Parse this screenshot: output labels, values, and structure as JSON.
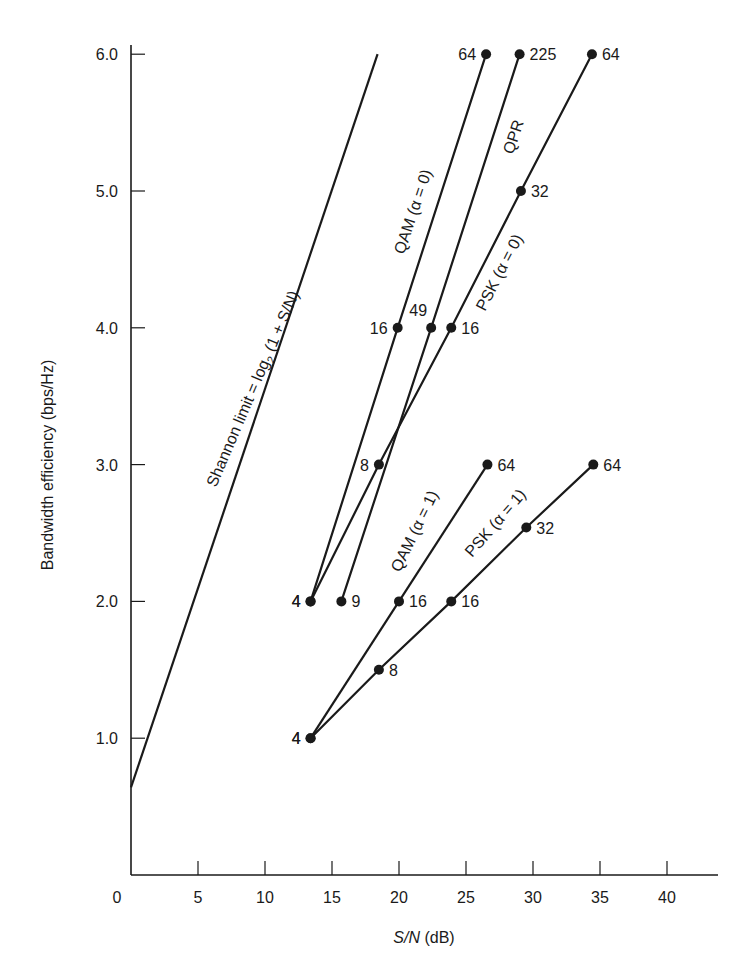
{
  "chart_data": {
    "type": "line",
    "title": "",
    "xlabel": "S/N (dB)",
    "ylabel": "Bandwidth efficiency (bps/Hz)",
    "xlim": [
      0,
      43
    ],
    "ylim": [
      0,
      6.4
    ],
    "grid": false,
    "legend": "none (inline labels along lines)",
    "x_ticks": [
      0,
      5,
      10,
      15,
      20,
      25,
      30,
      35,
      40
    ],
    "x_tick_labels": [
      "0",
      "5",
      "10",
      "15",
      "20",
      "25",
      "30",
      "35",
      "40"
    ],
    "y_ticks": [
      1.0,
      2.0,
      3.0,
      4.0,
      5.0,
      6.0
    ],
    "y_tick_labels": [
      "1.0",
      "2.0",
      "3.0",
      "4.0",
      "5.0",
      "6.0"
    ],
    "series": [
      {
        "name": "Shannon limit = log2 (1 + S/N)",
        "markers": false,
        "points": [
          {
            "x": 0,
            "y": 0.64,
            "label": ""
          },
          {
            "x": 18.4,
            "y": 6.0,
            "label": ""
          }
        ]
      },
      {
        "name": "QAM (α = 0)",
        "markers": true,
        "points": [
          {
            "x": 13.4,
            "y": 2.0,
            "label": "4"
          },
          {
            "x": 19.9,
            "y": 4.0,
            "label": "16"
          },
          {
            "x": 26.5,
            "y": 6.0,
            "label": "64"
          }
        ]
      },
      {
        "name": "QPR",
        "markers": true,
        "points": [
          {
            "x": 15.7,
            "y": 2.0,
            "label": "9"
          },
          {
            "x": 22.4,
            "y": 4.0,
            "label": "49"
          },
          {
            "x": 29.0,
            "y": 6.0,
            "label": "225"
          }
        ]
      },
      {
        "name": "PSK (α = 0)",
        "markers": true,
        "points": [
          {
            "x": 13.4,
            "y": 2.0,
            "label": "4"
          },
          {
            "x": 18.5,
            "y": 3.0,
            "label": "8"
          },
          {
            "x": 23.9,
            "y": 4.0,
            "label": "16"
          },
          {
            "x": 29.1,
            "y": 5.0,
            "label": "32"
          },
          {
            "x": 34.4,
            "y": 6.0,
            "label": "64"
          }
        ]
      },
      {
        "name": "QAM (α = 1)",
        "markers": true,
        "points": [
          {
            "x": 13.4,
            "y": 1.0,
            "label": "4"
          },
          {
            "x": 20.0,
            "y": 2.0,
            "label": "16"
          },
          {
            "x": 26.6,
            "y": 3.0,
            "label": "64"
          }
        ]
      },
      {
        "name": "PSK (α = 1)",
        "markers": true,
        "points": [
          {
            "x": 13.4,
            "y": 1.0,
            "label": "4"
          },
          {
            "x": 18.5,
            "y": 1.5,
            "label": "8"
          },
          {
            "x": 23.9,
            "y": 2.0,
            "label": "16"
          },
          {
            "x": 29.5,
            "y": 2.54,
            "label": "32"
          },
          {
            "x": 34.5,
            "y": 3.0,
            "label": "64"
          }
        ]
      }
    ],
    "point_label_placement": [
      {
        "series": "QAM (α = 0)",
        "labels": [
          "left",
          "left",
          "left"
        ]
      },
      {
        "series": "QPR",
        "labels": [
          "right",
          "above",
          "right"
        ]
      },
      {
        "series": "PSK (α = 0)",
        "labels": [
          "left",
          "left",
          "right",
          "right",
          "right"
        ]
      },
      {
        "series": "QAM (α = 1)",
        "labels": [
          "left",
          "right",
          "right"
        ]
      },
      {
        "series": "PSK (α = 1)",
        "labels": [
          "left",
          "right",
          "right",
          "right",
          "right"
        ]
      }
    ]
  },
  "annotations": {
    "shannon": "Shannon limit = log",
    "shannon_sub": "2",
    "shannon_tail": " (1 + S/N)",
    "qam0": "QAM (α = 0)",
    "qpr": "QPR",
    "psk0": "PSK (α = 0)",
    "qam1": "QAM (α = 1)",
    "psk1": "PSK (α = 1)"
  }
}
